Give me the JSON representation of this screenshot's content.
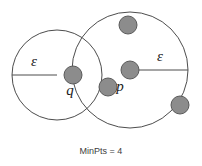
{
  "diagram": {
    "caption": "MinPts = 4",
    "background_color": "#ffffff",
    "stroke_color": "#4d4d4d",
    "point_fill_color": "#8c8c8c",
    "point_stroke_color": "#5a5a5a",
    "circles": [
      {
        "id": "q-neighborhood",
        "center_label": "q",
        "cx": 57,
        "cy": 75,
        "r": 45,
        "radius_label": "ε",
        "radius_label_x": 34,
        "radius_label_y": 63,
        "radius_line_x1": 12,
        "radius_line_y1": 75,
        "radius_line_x2": 57,
        "radius_line_y2": 75
      },
      {
        "id": "p-neighborhood",
        "center_label": "p",
        "cx": 130,
        "cy": 70,
        "r": 58,
        "radius_label": "ε",
        "radius_label_x": 160,
        "radius_label_y": 58,
        "radius_line_x1": 130,
        "radius_line_y1": 70,
        "radius_line_x2": 188,
        "radius_line_y2": 70
      }
    ],
    "points": [
      {
        "id": "point-q",
        "label": "q",
        "cx": 73,
        "cy": 75,
        "r": 9,
        "label_x": 70,
        "label_y": 92
      },
      {
        "id": "point-p",
        "label": "p",
        "cx": 130,
        "cy": 70,
        "r": 9,
        "label_x": 120,
        "label_y": 88
      },
      {
        "id": "point-top",
        "label": "",
        "cx": 128,
        "cy": 25,
        "r": 9,
        "label_x": 0,
        "label_y": 0
      },
      {
        "id": "point-middle",
        "label": "",
        "cx": 108,
        "cy": 87,
        "r": 9,
        "label_x": 0,
        "label_y": 0
      },
      {
        "id": "point-bottom-right",
        "label": "",
        "cx": 180,
        "cy": 105,
        "r": 9,
        "label_x": 0,
        "label_y": 0
      }
    ],
    "caption_x": 101,
    "caption_y": 152
  }
}
